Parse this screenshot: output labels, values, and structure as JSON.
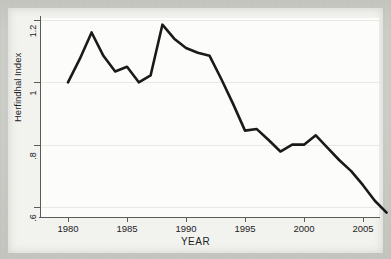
{
  "figure": {
    "title": "",
    "y_axis_title": "Herfindhal Index",
    "x_axis_title": "YEAR"
  },
  "axes": {
    "y_ticks": [
      {
        "label": "1.2",
        "value": 1.2
      },
      {
        "label": "1",
        "value": 1.0
      },
      {
        "label": ".8",
        "value": 0.8
      },
      {
        "label": ".6",
        "value": 0.6
      }
    ],
    "x_ticks": [
      {
        "label": "1980",
        "value": 1980
      },
      {
        "label": "1985",
        "value": 1985
      },
      {
        "label": "1990",
        "value": 1990
      },
      {
        "label": "1995",
        "value": 1995
      },
      {
        "label": "2000",
        "value": 2000
      },
      {
        "label": "2005",
        "value": 2005
      }
    ]
  },
  "colors": {
    "line": "#1a1a1a",
    "plot_background": "#fcfcfb",
    "gridline": "#e8e8e4",
    "axis": "#5a5a58",
    "page_background": "#cdcdc8"
  },
  "chart_data": {
    "type": "line",
    "title": "",
    "xlabel": "YEAR",
    "ylabel": "Herfindhal Index",
    "xlim": [
      1979.3,
      2007.5
    ],
    "ylim": [
      0.57,
      1.21
    ],
    "xticks": [
      1980,
      1985,
      1990,
      1995,
      2000,
      2005
    ],
    "yticks": [
      0.6,
      0.8,
      1.0,
      1.2
    ],
    "ytick_labels": [
      "6",
      "8",
      "1",
      "1.2"
    ],
    "grid": true,
    "grid_axis": "y",
    "legend": null,
    "series": [
      {
        "name": "Herfindhal Index",
        "x": [
          1980,
          1981,
          1982,
          1983,
          1984,
          1985,
          1986,
          1987,
          1988,
          1989,
          1990,
          1991,
          1992,
          1993,
          1994,
          1995,
          1996,
          1997,
          1998,
          1999,
          2000,
          2001,
          2002,
          2003,
          2004,
          2005,
          2006,
          2007
        ],
        "values": [
          1.0,
          1.075,
          1.16,
          1.085,
          1.035,
          1.05,
          1.0,
          1.022,
          1.185,
          1.14,
          1.11,
          1.095,
          1.085,
          1.01,
          0.93,
          0.845,
          0.85,
          0.815,
          0.778,
          0.8,
          0.8,
          0.83,
          0.79,
          0.75,
          0.715,
          0.67,
          0.62,
          0.582
        ]
      }
    ]
  }
}
